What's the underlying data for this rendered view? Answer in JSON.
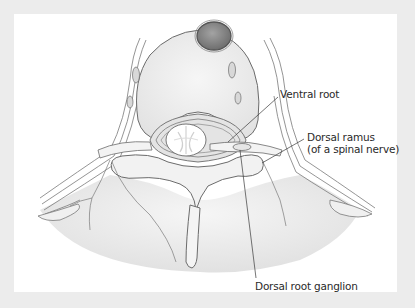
{
  "figure": {
    "background_color": "#ececec",
    "panel_color": "#ffffff",
    "stroke_color": "#6b6b6b",
    "bone_fill": "#efefef",
    "vessel_fill": "#8a8a8a"
  },
  "labels": [
    {
      "id": "ventral-root",
      "text": "Ventral root"
    },
    {
      "id": "dorsal-ramus",
      "line1": "Dorsal ramus",
      "line2": "(of a spinal nerve)"
    },
    {
      "id": "dorsal-root-ganglion",
      "text": "Dorsal root ganglion"
    }
  ]
}
